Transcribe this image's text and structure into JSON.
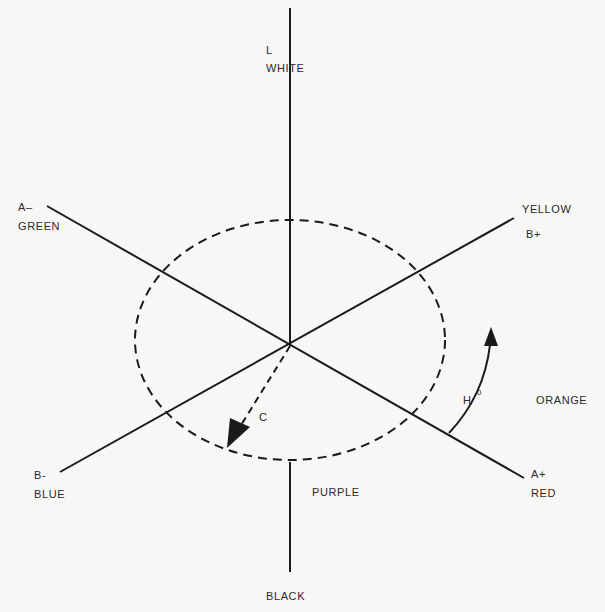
{
  "axes": {
    "lightness": {
      "symbol": "L",
      "top_label": "WHITE",
      "bottom_label": "BLACK"
    },
    "a_axis": {
      "negative_symbol": "A–",
      "negative_label": "GREEN",
      "positive_symbol": "A+",
      "positive_label": "RED"
    },
    "b_axis": {
      "negative_symbol": "B-",
      "negative_label": "BLUE",
      "positive_symbol": "B+",
      "positive_label": "YELLOW"
    }
  },
  "annotations": {
    "chroma_symbol": "C",
    "hue_symbol": "H",
    "hue_superscript": "0",
    "orange_label": "ORANGE",
    "purple_label": "PURPLE"
  },
  "colors": {
    "ink": "#1a1a1a",
    "paper": "#f7f7f5"
  }
}
